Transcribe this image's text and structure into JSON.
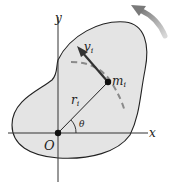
{
  "diagram": {
    "labels": {
      "y_axis": "y",
      "x_axis": "x",
      "origin": "O",
      "mass": "m",
      "mass_sub": "i",
      "velocity": "v",
      "velocity_sub": "i",
      "radius": "r",
      "radius_sub": "i",
      "angle": "θ"
    },
    "colors": {
      "body_fill": "#e4e4e4",
      "body_outline": "#222222",
      "velocity_arrow": "#333333",
      "dashed_path": "#8a8a8a",
      "rotation_arrow": "#9a9a9a",
      "axes": "#333333"
    }
  }
}
